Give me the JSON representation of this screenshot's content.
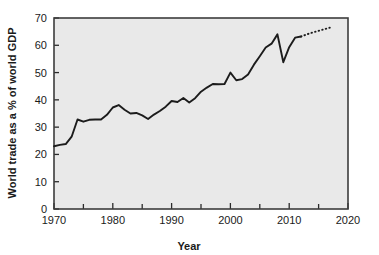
{
  "chart_data": {
    "type": "line",
    "title": "",
    "xlabel": "Year",
    "ylabel": "World trade as a % of world GDP",
    "xlim": [
      1970,
      2020
    ],
    "ylim": [
      0,
      70
    ],
    "grid": false,
    "legend": null,
    "x_ticks": [
      1970,
      1980,
      1990,
      2000,
      2010,
      2020
    ],
    "x_tick_labels": [
      "1970",
      "1980",
      "1990",
      "2000",
      "2010",
      "2020"
    ],
    "x_minor_ticks": [
      1975,
      1985,
      1995,
      2005,
      2015
    ],
    "y_ticks": [
      0,
      10,
      20,
      30,
      40,
      50,
      60,
      70
    ],
    "y_tick_labels": [
      "0",
      "10",
      "20",
      "30",
      "40",
      "50",
      "60",
      "70"
    ],
    "series": [
      {
        "name": "World trade (actual)",
        "style": "solid",
        "x": [
          1970,
          1971,
          1972,
          1973,
          1974,
          1975,
          1976,
          1977,
          1978,
          1979,
          1980,
          1981,
          1982,
          1983,
          1984,
          1985,
          1986,
          1987,
          1988,
          1989,
          1990,
          1991,
          1992,
          1993,
          1994,
          1995,
          1996,
          1997,
          1998,
          1999,
          2000,
          2001,
          2002,
          2003,
          2004,
          2005,
          2006,
          2007,
          2008,
          2009,
          2010,
          2011,
          2012
        ],
        "values": [
          23.0,
          23.5,
          23.8,
          26.5,
          32.8,
          32.0,
          32.7,
          32.8,
          32.8,
          34.5,
          37.2,
          38.1,
          36.4,
          35.0,
          35.2,
          34.3,
          33.0,
          34.6,
          35.9,
          37.5,
          39.6,
          39.2,
          40.7,
          39.0,
          40.6,
          43.0,
          44.5,
          45.8,
          45.7,
          45.8,
          50.0,
          47.2,
          47.6,
          49.3,
          52.9,
          56.0,
          59.2,
          60.6,
          64.0,
          53.8,
          59.3,
          62.8,
          63.2
        ]
      },
      {
        "name": "World trade (projected)",
        "style": "dotted",
        "x": [
          2012,
          2013,
          2014,
          2015,
          2016,
          2017
        ],
        "values": [
          63.2,
          64.0,
          64.7,
          65.3,
          65.9,
          66.5
        ]
      }
    ]
  },
  "axes": {
    "x_label": "Year",
    "y_label": "World trade as a % of world GDP"
  }
}
